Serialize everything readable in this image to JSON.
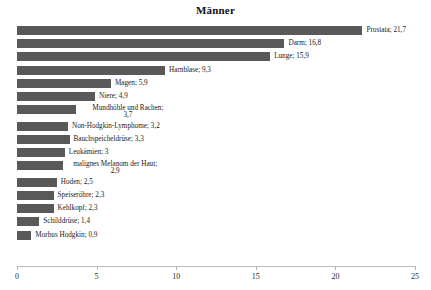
{
  "chart_data": {
    "type": "bar",
    "orientation": "horizontal",
    "title": "Männer",
    "xlabel": "",
    "ylabel": "",
    "xlim": [
      0,
      25
    ],
    "xticks": [
      "0",
      "5",
      "10",
      "15",
      "20",
      "25"
    ],
    "grid": false,
    "legend": "none",
    "bar_color": "#595959",
    "axis_color": "#b8b8b8",
    "categories": [
      "Prostata",
      "Darm",
      "Lunge",
      "Harnblase",
      "Magen",
      "Niere",
      "Mundhöhle und Rachen",
      "Non-Hodgkin-Lymphome",
      "Bauchspeicheldrüse",
      "Leukämien",
      "malignes Melanom der Haut",
      "Hoden",
      "Speiseröhre",
      "Kehlkopf",
      "Schilddrüse",
      "Morbus Hodgkin"
    ],
    "values": [
      21.7,
      16.8,
      15.9,
      9.3,
      5.9,
      4.9,
      3.7,
      3.2,
      3.3,
      3,
      2.9,
      2.5,
      2.3,
      2.3,
      1.4,
      0.9
    ],
    "data_labels": [
      "Prostata; 21,7",
      "Darm; 16,8",
      "Lunge; 15,9",
      "Harnblase; 9,3",
      "Magen; 5,9",
      "Niere; 4,9",
      "Mundhöhle und Rachen; 3,7",
      "Non-Hodgkin-Lymphome; 3,2",
      "Bauchspeicheldrüse; 3,3",
      "Leukämien; 3",
      "malignes Melanom der Haut; 2,9",
      "Hoden; 2,5",
      "Speiseröhre; 2,3",
      "Kehlkopf; 2,3",
      "Schilddrüse; 1,4",
      "Morbus Hodgkin; 0,9"
    ],
    "data_labels_line1": [
      "Prostata; 21,7",
      "Darm; 16,8",
      "Lunge; 15,9",
      "Harnblase; 9,3",
      "Magen; 5,9",
      "Niere; 4,9",
      "Mundhöhle und Rachen;",
      "Non-Hodgkin-Lymphome; 3,2",
      "Bauchspeicheldrüse; 3,3",
      "Leukämien; 3",
      "malignes Melanom der Haut;",
      "Hoden; 2,5",
      "Speiseröhre; 2,3",
      "Kehlkopf; 2,3",
      "Schilddrüse; 1,4",
      "Morbus Hodgkin; 0,9"
    ],
    "data_labels_line2": [
      "",
      "",
      "",
      "",
      "",
      "",
      "3,7",
      "",
      "",
      "",
      "2,9",
      "",
      "",
      "",
      "",
      ""
    ]
  }
}
